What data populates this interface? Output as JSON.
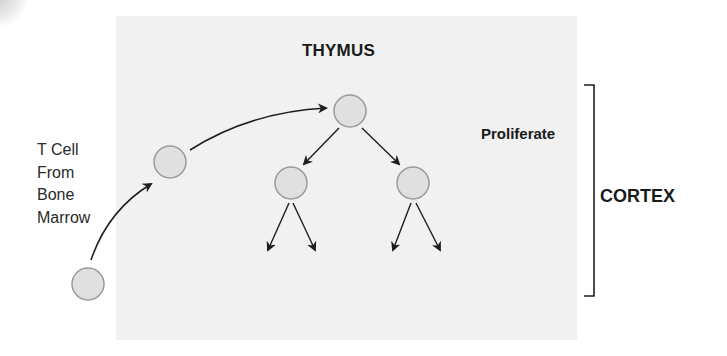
{
  "title": "THYMUS",
  "origin_label": {
    "lines": [
      "T Cell",
      "From",
      "Bone",
      "Marrow"
    ]
  },
  "stage_label": "Proliferate",
  "region_label": "CORTEX",
  "colors": {
    "region_background": "#f1f1f1",
    "cell_fill": "#e0e0e0",
    "cell_stroke": "#9a9a9a",
    "arrow": "#1e1e1e",
    "text": "#1a1a1a"
  },
  "cells": [
    {
      "id": "marrow-cell",
      "cx": 88,
      "cy": 284,
      "r": 16
    },
    {
      "id": "entering-cell",
      "cx": 170,
      "cy": 162,
      "r": 16
    },
    {
      "id": "parent-cell",
      "cx": 350,
      "cy": 111,
      "r": 16
    },
    {
      "id": "daughter-cell-left",
      "cx": 291,
      "cy": 183,
      "r": 16
    },
    {
      "id": "daughter-cell-right",
      "cx": 413,
      "cy": 183,
      "r": 16
    }
  ]
}
